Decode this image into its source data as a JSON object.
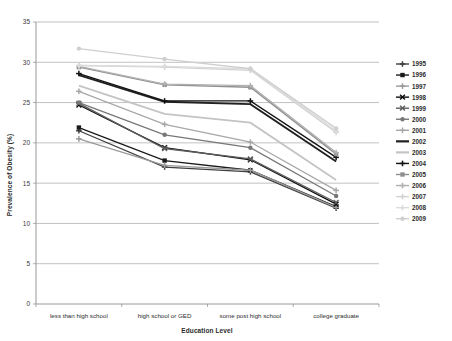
{
  "chart_data": {
    "type": "line",
    "title": "",
    "xlabel": "Education Level",
    "ylabel": "Prevalence of Obesity (%)",
    "categories": [
      "less than high school",
      "high school or GED",
      "some post high school",
      "college graduate"
    ],
    "ylim": [
      0,
      35
    ],
    "yticks": [
      0,
      5,
      10,
      15,
      20,
      25,
      30,
      35
    ],
    "grid": "horizontal",
    "legend_position": "right",
    "series": [
      {
        "name": "1995",
        "values": [
          21.5,
          17.0,
          16.4,
          11.9
        ],
        "color": "#404040",
        "marker": "plus"
      },
      {
        "name": "1996",
        "values": [
          21.9,
          17.8,
          16.6,
          12.1
        ],
        "color": "#1a1a1a",
        "marker": "square"
      },
      {
        "name": "1997",
        "values": [
          20.5,
          17.2,
          16.6,
          12.0
        ],
        "color": "#9a9a9a",
        "marker": "plus"
      },
      {
        "name": "1998",
        "values": [
          24.7,
          19.4,
          17.9,
          12.4
        ],
        "color": "#0d0d0d",
        "marker": "cross"
      },
      {
        "name": "1999",
        "values": [
          24.9,
          19.3,
          18.0,
          12.6
        ],
        "color": "#5c5c5c",
        "marker": "cross"
      },
      {
        "name": "2000",
        "values": [
          25.0,
          21.0,
          19.4,
          13.4
        ],
        "color": "#777777",
        "marker": "circle"
      },
      {
        "name": "2001",
        "values": [
          26.4,
          22.3,
          20.1,
          14.1
        ],
        "color": "#a8a8a8",
        "marker": "plus"
      },
      {
        "name": "2002",
        "values": [
          28.4,
          25.1,
          24.8,
          17.7
        ],
        "color": "#202020",
        "marker": "line"
      },
      {
        "name": "2003",
        "values": [
          27.1,
          23.6,
          22.5,
          15.4
        ],
        "color": "#c4c4c4",
        "marker": "line"
      },
      {
        "name": "2004",
        "values": [
          28.6,
          25.2,
          25.2,
          18.2
        ],
        "color": "#121212",
        "marker": "plus"
      },
      {
        "name": "2005",
        "values": [
          29.4,
          27.2,
          26.9,
          18.6
        ],
        "color": "#8f8f8f",
        "marker": "square"
      },
      {
        "name": "2006",
        "values": [
          29.5,
          27.3,
          27.1,
          18.8
        ],
        "color": "#b0b0b0",
        "marker": "plus"
      },
      {
        "name": "2007",
        "values": [
          29.6,
          29.4,
          29.0,
          21.3
        ],
        "color": "#d2d2d2",
        "marker": "plus"
      },
      {
        "name": "2008",
        "values": [
          29.6,
          29.5,
          29.2,
          21.5
        ],
        "color": "#dcdcdc",
        "marker": "plus"
      },
      {
        "name": "2009",
        "values": [
          31.7,
          30.4,
          29.2,
          21.8
        ],
        "color": "#cfcfcf",
        "marker": "circle"
      }
    ]
  }
}
